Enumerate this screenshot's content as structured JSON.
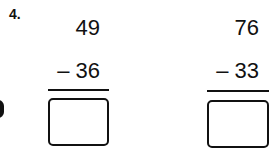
{
  "problem_number": "4.",
  "problems": [
    {
      "minuend": "49",
      "subtrahend_line": "– 36",
      "answer": ""
    },
    {
      "minuend": "76",
      "subtrahend_line": "– 33",
      "answer": ""
    }
  ]
}
